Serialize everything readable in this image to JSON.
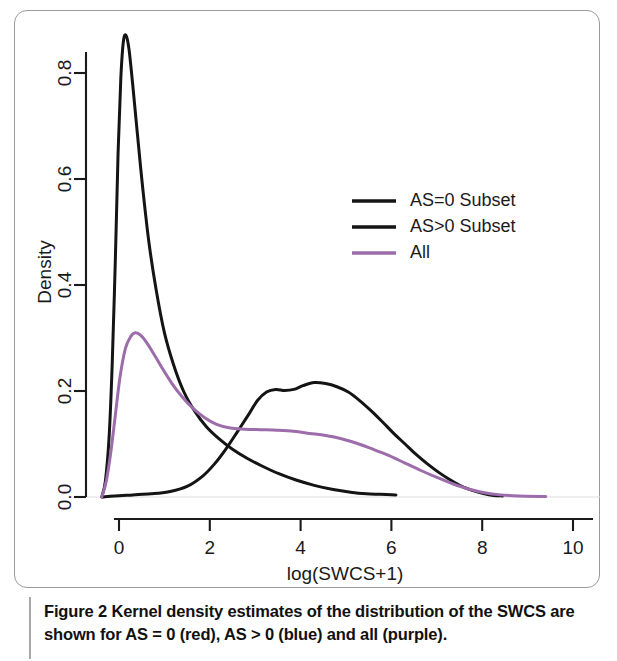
{
  "figure": {
    "caption_label": "Figure 2",
    "caption_text": " Kernel density estimates of the distribution of the SWCS are shown for AS = 0 (red), AS > 0 (blue) and all (purple)."
  },
  "chart_data": {
    "type": "line",
    "title": "",
    "xlabel": "log(SWCS+1)",
    "ylabel": "Density",
    "xlim": [
      -1.1,
      10.6
    ],
    "ylim": [
      -0.02,
      0.92
    ],
    "xticks": [
      0,
      2,
      4,
      6,
      8,
      10
    ],
    "xtick_labels": [
      "0",
      "2",
      "4",
      "6",
      "8",
      "10"
    ],
    "yticks": [
      0.0,
      0.2,
      0.4,
      0.6,
      0.8
    ],
    "ytick_labels": [
      "0.0",
      "0.2",
      "0.4",
      "0.6",
      "0.8"
    ],
    "grid": false,
    "legend_position": "upper-right-inside",
    "series": [
      {
        "name": "AS=0 Subset",
        "caption_color_name": "red",
        "color": "#141414",
        "width": 3.0,
        "points": [
          [
            -0.38,
            0.0
          ],
          [
            -0.3,
            0.03
          ],
          [
            -0.22,
            0.11
          ],
          [
            -0.15,
            0.25
          ],
          [
            -0.08,
            0.45
          ],
          [
            -0.02,
            0.65
          ],
          [
            0.04,
            0.79
          ],
          [
            0.1,
            0.862
          ],
          [
            0.16,
            0.87
          ],
          [
            0.22,
            0.845
          ],
          [
            0.3,
            0.78
          ],
          [
            0.4,
            0.69
          ],
          [
            0.52,
            0.585
          ],
          [
            0.66,
            0.48
          ],
          [
            0.82,
            0.39
          ],
          [
            1.0,
            0.31
          ],
          [
            1.2,
            0.25
          ],
          [
            1.42,
            0.2
          ],
          [
            1.66,
            0.163
          ],
          [
            1.92,
            0.133
          ],
          [
            2.2,
            0.11
          ],
          [
            2.5,
            0.09
          ],
          [
            2.82,
            0.073
          ],
          [
            3.16,
            0.058
          ],
          [
            3.52,
            0.044
          ],
          [
            3.9,
            0.032
          ],
          [
            4.3,
            0.022
          ],
          [
            4.72,
            0.014
          ],
          [
            5.1,
            0.009
          ],
          [
            5.45,
            0.006
          ],
          [
            5.75,
            0.005
          ],
          [
            6.1,
            0.004
          ]
        ]
      },
      {
        "name": "AS>0 Subset",
        "caption_color_name": "blue",
        "color": "#141414",
        "width": 3.0,
        "points": [
          [
            -0.35,
            0.0
          ],
          [
            -0.1,
            0.002
          ],
          [
            0.3,
            0.004
          ],
          [
            0.7,
            0.006
          ],
          [
            1.1,
            0.01
          ],
          [
            1.5,
            0.02
          ],
          [
            1.85,
            0.04
          ],
          [
            2.1,
            0.062
          ],
          [
            2.35,
            0.09
          ],
          [
            2.6,
            0.122
          ],
          [
            2.85,
            0.155
          ],
          [
            3.05,
            0.182
          ],
          [
            3.25,
            0.198
          ],
          [
            3.45,
            0.203
          ],
          [
            3.65,
            0.201
          ],
          [
            3.85,
            0.203
          ],
          [
            4.05,
            0.21
          ],
          [
            4.3,
            0.216
          ],
          [
            4.55,
            0.214
          ],
          [
            4.8,
            0.208
          ],
          [
            5.05,
            0.198
          ],
          [
            5.3,
            0.182
          ],
          [
            5.55,
            0.163
          ],
          [
            5.8,
            0.142
          ],
          [
            6.05,
            0.12
          ],
          [
            6.3,
            0.1
          ],
          [
            6.55,
            0.08
          ],
          [
            6.8,
            0.062
          ],
          [
            7.05,
            0.046
          ],
          [
            7.3,
            0.032
          ],
          [
            7.55,
            0.02
          ],
          [
            7.8,
            0.012
          ],
          [
            8.05,
            0.006
          ],
          [
            8.25,
            0.003
          ],
          [
            8.45,
            0.002
          ]
        ]
      },
      {
        "name": "All",
        "caption_color_name": "purple",
        "color": "#9c6cab",
        "width": 3.0,
        "points": [
          [
            -0.38,
            0.0
          ],
          [
            -0.28,
            0.03
          ],
          [
            -0.18,
            0.085
          ],
          [
            -0.08,
            0.155
          ],
          [
            0.02,
            0.225
          ],
          [
            0.14,
            0.28
          ],
          [
            0.26,
            0.303
          ],
          [
            0.36,
            0.31
          ],
          [
            0.48,
            0.305
          ],
          [
            0.62,
            0.29
          ],
          [
            0.78,
            0.268
          ],
          [
            0.96,
            0.242
          ],
          [
            1.16,
            0.215
          ],
          [
            1.38,
            0.19
          ],
          [
            1.62,
            0.168
          ],
          [
            1.88,
            0.15
          ],
          [
            2.15,
            0.137
          ],
          [
            2.45,
            0.13
          ],
          [
            2.78,
            0.128
          ],
          [
            3.12,
            0.127
          ],
          [
            3.48,
            0.126
          ],
          [
            3.85,
            0.124
          ],
          [
            4.2,
            0.12
          ],
          [
            4.55,
            0.116
          ],
          [
            4.9,
            0.11
          ],
          [
            5.25,
            0.101
          ],
          [
            5.6,
            0.09
          ],
          [
            5.95,
            0.078
          ],
          [
            6.3,
            0.064
          ],
          [
            6.65,
            0.05
          ],
          [
            7.0,
            0.037
          ],
          [
            7.35,
            0.025
          ],
          [
            7.7,
            0.015
          ],
          [
            8.05,
            0.008
          ],
          [
            8.4,
            0.004
          ],
          [
            8.8,
            0.002
          ],
          [
            9.4,
            0.001
          ]
        ]
      }
    ],
    "legend": [
      {
        "label": "AS=0 Subset",
        "color": "#141414"
      },
      {
        "label": "AS>0 Subset",
        "color": "#141414"
      },
      {
        "label": "All",
        "color": "#9c6cab"
      }
    ]
  }
}
